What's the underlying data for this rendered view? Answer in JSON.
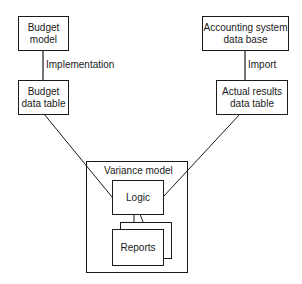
{
  "diagram": {
    "nodes": {
      "budget_model": "Budget model",
      "budget_model_l1": "Budget",
      "budget_model_l2": "model",
      "budget_table_l1": "Budget",
      "budget_table_l2": "data table",
      "accounting_l1": "Accounting system",
      "accounting_l2": "data base",
      "actual_l1": "Actual results",
      "actual_l2": "data table",
      "variance_model": "Variance model",
      "logic": "Logic",
      "reports": "Reports"
    },
    "edges": {
      "implementation": "Implementation",
      "import": "Import"
    }
  }
}
